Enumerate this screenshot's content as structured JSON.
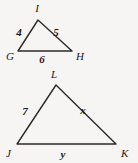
{
  "figure": {
    "background_color": "#f6f5f3",
    "stroke_color": "#2b2b2b",
    "text_color": "#1a1a1a",
    "triangles": [
      {
        "name": "triangle-ghi",
        "vertices": [
          {
            "label": "I",
            "x": 38,
            "y": 20,
            "label_x": 37,
            "label_y": 12
          },
          {
            "label": "G",
            "x": 18,
            "y": 51,
            "label_x": 6,
            "label_y": 60
          },
          {
            "label": "H",
            "x": 72,
            "y": 51,
            "label_x": 76,
            "label_y": 60
          }
        ],
        "sides": [
          {
            "name": "side-gi",
            "label": "4",
            "label_x": 19,
            "label_y": 36
          },
          {
            "name": "side-ih",
            "label": "5",
            "label_x": 56,
            "label_y": 36
          },
          {
            "name": "side-gh",
            "label": "6",
            "label_x": 42,
            "label_y": 63
          }
        ]
      },
      {
        "name": "triangle-jkl",
        "vertices": [
          {
            "label": "L",
            "x": 56,
            "y": 85,
            "label_x": 54,
            "label_y": 78
          },
          {
            "label": "J",
            "x": 17,
            "y": 144,
            "label_x": 6,
            "label_y": 157
          },
          {
            "label": "K",
            "x": 116,
            "y": 144,
            "label_x": 121,
            "label_y": 157
          }
        ],
        "sides": [
          {
            "name": "side-jl",
            "label": "7",
            "label_x": 25,
            "label_y": 115
          },
          {
            "name": "side-lk",
            "label": "x",
            "label_x": 83,
            "label_y": 114
          },
          {
            "name": "side-jk",
            "label": "y",
            "label_x": 63,
            "label_y": 158
          }
        ]
      }
    ]
  }
}
